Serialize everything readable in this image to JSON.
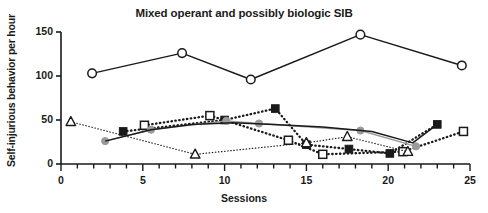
{
  "chart_data": {
    "type": "line",
    "title": "Mixed operant and possibly biologic SIB",
    "xlabel": "Sessions",
    "ylabel": "Self-injurious behavior per hour",
    "xlim": [
      0,
      25
    ],
    "ylim": [
      0,
      150
    ],
    "grid": false,
    "legend": "none",
    "x_ticks": [
      0,
      5,
      10,
      15,
      20,
      25
    ],
    "x_minor_tick_step": 1,
    "y_ticks": [
      0,
      50,
      100,
      150
    ],
    "x_tick_labels": [
      "0",
      "5",
      "10",
      "15",
      "20",
      "25"
    ],
    "y_tick_labels": [
      "0",
      "50",
      "100",
      "150"
    ],
    "series": [
      {
        "name": "open-circle-series",
        "marker": "open-circle",
        "line_style": "solid",
        "color": "#1a1a1a",
        "marker_fill": "#ffffff",
        "points": [
          {
            "x": 1.9,
            "y": 103
          },
          {
            "x": 7.4,
            "y": 126
          },
          {
            "x": 11.6,
            "y": 96
          },
          {
            "x": 18.3,
            "y": 147
          },
          {
            "x": 24.5,
            "y": 112
          }
        ]
      },
      {
        "name": "filled-square-series",
        "marker": "filled-square",
        "line_style": "dotted-thick",
        "color": "#1a1a1a",
        "marker_fill": "#1a1a1a",
        "points": [
          {
            "x": 3.8,
            "y": 37
          },
          {
            "x": 10.0,
            "y": 50
          },
          {
            "x": 13.1,
            "y": 63
          },
          {
            "x": 15.0,
            "y": 22
          },
          {
            "x": 17.6,
            "y": 17
          },
          {
            "x": 20.1,
            "y": 12
          },
          {
            "x": 23.0,
            "y": 45
          }
        ]
      },
      {
        "name": "open-square-series",
        "marker": "open-square",
        "line_style": "dotted-thick",
        "color": "#1a1a1a",
        "marker_fill": "#ffffff",
        "points": [
          {
            "x": 5.1,
            "y": 44
          },
          {
            "x": 9.1,
            "y": 55
          },
          {
            "x": 13.9,
            "y": 27
          },
          {
            "x": 16.0,
            "y": 11
          },
          {
            "x": 20.9,
            "y": 14
          },
          {
            "x": 24.6,
            "y": 37
          }
        ]
      },
      {
        "name": "gray-circle-series",
        "marker": "filled-circle",
        "line_style": "solid",
        "color": "#9a9a9a",
        "marker_fill": "#9a9a9a",
        "points": [
          {
            "x": 2.7,
            "y": 26
          },
          {
            "x": 5.5,
            "y": 39
          },
          {
            "x": 10.1,
            "y": 49
          },
          {
            "x": 12.1,
            "y": 46
          },
          {
            "x": 18.3,
            "y": 38
          },
          {
            "x": 21.7,
            "y": 20
          }
        ]
      },
      {
        "name": "open-triangle-series",
        "marker": "open-triangle",
        "line_style": "dotted-fine",
        "color": "#1a1a1a",
        "marker_fill": "#ffffff",
        "points": [
          {
            "x": 0.6,
            "y": 48
          },
          {
            "x": 8.2,
            "y": 11
          },
          {
            "x": 15.0,
            "y": 24
          },
          {
            "x": 17.5,
            "y": 31
          },
          {
            "x": 21.2,
            "y": 14
          }
        ]
      },
      {
        "name": "dark-trend-curve",
        "marker": "none",
        "line_style": "solid",
        "color": "#1a1a1a",
        "marker_fill": "none",
        "points": [
          {
            "x": 2.7,
            "y": 26
          },
          {
            "x": 5.5,
            "y": 39
          },
          {
            "x": 8.0,
            "y": 45
          },
          {
            "x": 10.5,
            "y": 47
          },
          {
            "x": 13.0,
            "y": 45
          },
          {
            "x": 16.0,
            "y": 42
          },
          {
            "x": 19.0,
            "y": 37
          },
          {
            "x": 21.5,
            "y": 24
          },
          {
            "x": 23.0,
            "y": 45
          }
        ]
      }
    ]
  }
}
